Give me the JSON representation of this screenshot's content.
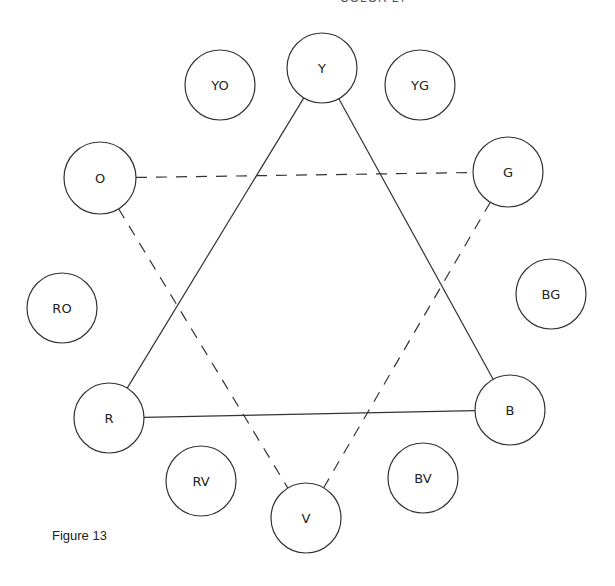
{
  "header": {
    "fragment": "COLOR 27"
  },
  "caption": "Figure 13",
  "chart_data": {
    "type": "diagram",
    "nodes": [
      {
        "id": "Y",
        "label": "Y",
        "x": 322,
        "y": 68,
        "r": 35
      },
      {
        "id": "YO",
        "label": "YO",
        "x": 220,
        "y": 85,
        "r": 35
      },
      {
        "id": "YG",
        "label": "YG",
        "x": 420,
        "y": 85,
        "r": 35
      },
      {
        "id": "O",
        "label": "O",
        "x": 100,
        "y": 178,
        "r": 36
      },
      {
        "id": "G",
        "label": "G",
        "x": 508,
        "y": 172,
        "r": 35
      },
      {
        "id": "RO",
        "label": "RO",
        "x": 62,
        "y": 308,
        "r": 35
      },
      {
        "id": "BG",
        "label": "BG",
        "x": 551,
        "y": 294,
        "r": 35
      },
      {
        "id": "R",
        "label": "R",
        "x": 109,
        "y": 418,
        "r": 35
      },
      {
        "id": "B",
        "label": "B",
        "x": 510,
        "y": 410,
        "r": 35
      },
      {
        "id": "RV",
        "label": "RV",
        "x": 201,
        "y": 481,
        "r": 35
      },
      {
        "id": "BV",
        "label": "BV",
        "x": 423,
        "y": 478,
        "r": 35
      },
      {
        "id": "V",
        "label": "V",
        "x": 306,
        "y": 518,
        "r": 35
      }
    ],
    "edges": [
      {
        "from": "Y",
        "to": "R",
        "style": "solid"
      },
      {
        "from": "Y",
        "to": "B",
        "style": "solid"
      },
      {
        "from": "R",
        "to": "B",
        "style": "solid"
      },
      {
        "from": "O",
        "to": "G",
        "style": "dashed"
      },
      {
        "from": "O",
        "to": "V",
        "style": "dashed"
      },
      {
        "from": "G",
        "to": "V",
        "style": "dashed"
      }
    ]
  }
}
